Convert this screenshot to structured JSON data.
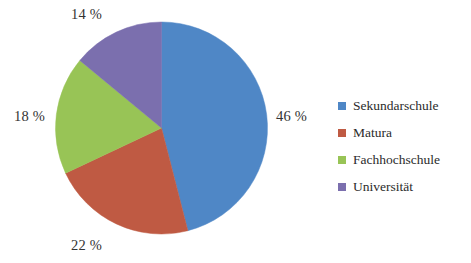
{
  "chart_data": {
    "type": "pie",
    "title": "",
    "subtitle": "",
    "xlabel": "",
    "ylabel": "",
    "categories": [
      "Sekundarschule",
      "Matura",
      "Fachhochschule",
      "Universität"
    ],
    "values": [
      46,
      22,
      18,
      14
    ],
    "value_unit": "%",
    "data_labels": [
      "46 %",
      "22 %",
      "18 %",
      "14 %"
    ],
    "colors": [
      "#4f87c6",
      "#bf5a43",
      "#98c456",
      "#7b6fae"
    ],
    "start_angle_deg": 0,
    "direction": "clockwise",
    "legend_position": "right",
    "grid": false,
    "slices": [
      {
        "label": "Sekundarschule",
        "value": 46,
        "data_label": "46 %",
        "color": "#4f87c6"
      },
      {
        "label": "Matura",
        "value": 22,
        "data_label": "22 %",
        "color": "#bf5a43"
      },
      {
        "label": "Fachhochschule",
        "value": 18,
        "data_label": "18 %",
        "color": "#98c456"
      },
      {
        "label": "Universität",
        "value": 14,
        "data_label": "14 %",
        "color": "#7b6fae"
      }
    ]
  },
  "labels": {
    "top": "14 %",
    "right": "46 %",
    "left": "18 %",
    "bottom": "22 %"
  },
  "legend": {
    "items": [
      {
        "label": "Sekundarschule",
        "color": "#4f87c6"
      },
      {
        "label": "Matura",
        "color": "#bf5a43"
      },
      {
        "label": "Fachhochschule",
        "color": "#98c456"
      },
      {
        "label": "Universität",
        "color": "#7b6fae"
      }
    ]
  }
}
